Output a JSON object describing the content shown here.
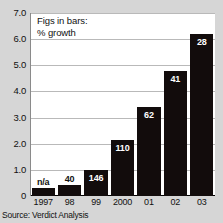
{
  "chart_data": {
    "type": "bar",
    "title": "",
    "annotation_lines": [
      "Figs in bars:",
      "% growth"
    ],
    "categories": [
      "1997",
      "98",
      "99",
      "2000",
      "01",
      "02",
      "03"
    ],
    "values": [
      0.3,
      0.42,
      1.0,
      2.15,
      3.4,
      4.8,
      6.2
    ],
    "bar_labels": [
      "n/a",
      "40",
      "146",
      "110",
      "62",
      "41",
      "28"
    ],
    "xlabel": "",
    "ylabel": "",
    "ylim": [
      0,
      7.0
    ],
    "ytick_labels": [
      "0",
      "1.0",
      "2.0",
      "3.0",
      "4.0",
      "5.0",
      "6.0",
      "7.0"
    ],
    "ytick_values": [
      0,
      1.0,
      2.0,
      3.0,
      4.0,
      5.0,
      6.0,
      7.0
    ],
    "grid": true,
    "legend": "none",
    "source": "Source: Verdict Analysis",
    "colors": {
      "bar": "#120c0c",
      "bar_label_text": "#ffffff",
      "plot_background": "#ffffff",
      "figure_background": "#d6d6d6",
      "gridline": "#b9b9b9",
      "axis_text": "#111111"
    }
  }
}
